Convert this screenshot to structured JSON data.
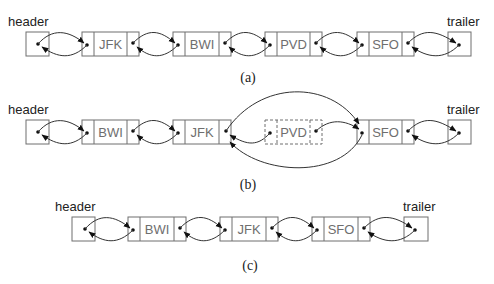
{
  "diagram": {
    "colors": {
      "box_stroke": "#6e6e6e",
      "arrow": "#333333",
      "text": "#222222"
    },
    "rows": [
      {
        "id": "a",
        "caption": "(a)",
        "header_label": "header",
        "trailer_label": "trailer",
        "nodes": [
          "JFK",
          "BWI",
          "PVD",
          "SFO"
        ]
      },
      {
        "id": "b",
        "caption": "(b)",
        "header_label": "header",
        "trailer_label": "trailer",
        "nodes": [
          "BWI",
          "JFK",
          "PVD",
          "SFO"
        ],
        "removed_node": "PVD"
      },
      {
        "id": "c",
        "caption": "(c)",
        "header_label": "header",
        "trailer_label": "trailer",
        "nodes": [
          "BWI",
          "JFK",
          "SFO"
        ]
      }
    ]
  }
}
